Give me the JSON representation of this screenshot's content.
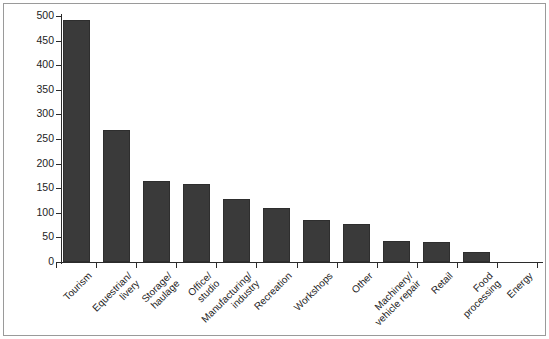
{
  "chart_data": {
    "type": "bar",
    "title": "",
    "subtitle": "",
    "xlabel": "",
    "ylabel": "Number of applications",
    "ylim": [
      0,
      500
    ],
    "yticks": [
      0,
      50,
      100,
      150,
      200,
      250,
      300,
      350,
      400,
      450,
      500
    ],
    "ytick_labels": [
      "0",
      "50",
      "100",
      "150",
      "200",
      "250",
      "300",
      "350",
      "400",
      "450",
      "500"
    ],
    "grid": false,
    "legend": null,
    "bar_color": "#3a3a3a",
    "categories": [
      "Tourism",
      "Equestrian/\nlivery",
      "Storage/\nhaulage",
      "Office/\nstudio",
      "Manufacturing/\nindustry",
      "Recreation",
      "Workshops",
      "Other",
      "Machinery/\nvehicle repair",
      "Retail",
      "Food\nprocessing",
      "Energy"
    ],
    "values": [
      492,
      268,
      165,
      158,
      128,
      110,
      85,
      78,
      43,
      40,
      20,
      1
    ]
  }
}
